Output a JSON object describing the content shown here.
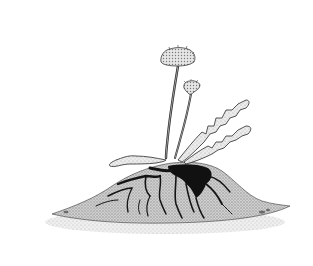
{
  "image": {
    "subject": "dandelion plant on soil mound with roots",
    "style": "grayscale pen-and-ink illustration",
    "width": 313,
    "height": 266
  },
  "colors": {
    "background": "#ffffff",
    "ink": "#1a1a1a",
    "mid_gray": "#8a8a8a",
    "light_gray": "#c8c8c8",
    "soil_fill": "#bdbdbd",
    "soil_light": "#dcdcdc",
    "root_dark": "#111111"
  },
  "elements": {
    "flower_heads": [
      {
        "name": "large-flower-head",
        "cx": 178,
        "cy": 57,
        "rx": 17,
        "ry": 9
      },
      {
        "name": "small-flower-head",
        "cx": 192,
        "cy": 88,
        "rx": 9,
        "ry": 6
      }
    ],
    "stems": [
      {
        "name": "large-stem",
        "from": [
          178,
          66
        ],
        "to": [
          166,
          158
        ]
      },
      {
        "name": "small-stem",
        "from": [
          191,
          94
        ],
        "to": [
          176,
          158
        ]
      }
    ],
    "leaves": [
      {
        "name": "upper-right-leaf",
        "tip": [
          248,
          102
        ]
      },
      {
        "name": "lower-right-leaf",
        "tip": [
          250,
          128
        ]
      },
      {
        "name": "left-leaf",
        "tip": [
          110,
          165
        ]
      }
    ],
    "mound": {
      "base_left": [
        55,
        212
      ],
      "peak": [
        180,
        164
      ],
      "base_right": [
        282,
        205
      ]
    }
  }
}
